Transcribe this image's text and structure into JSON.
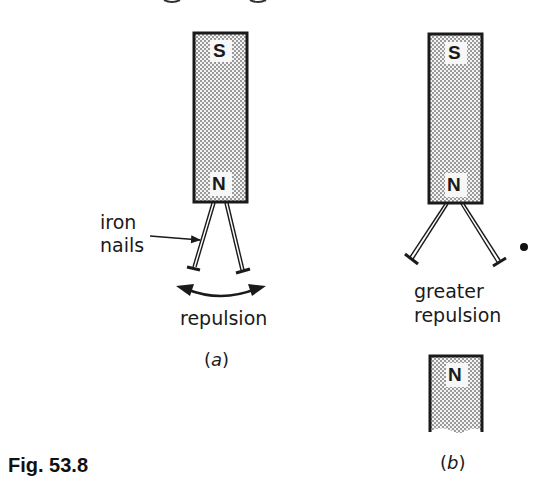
{
  "figure": {
    "label": "Fig. 53.8",
    "heading_fragment": "clipped heading text at top edge (not legible)"
  },
  "panel_a": {
    "caption_open": "(",
    "caption_letter": "a",
    "caption_close": ")",
    "magnet": {
      "top_pole": "S",
      "bottom_pole": "N"
    },
    "annotation_line1": "iron",
    "annotation_line2": "nails",
    "effect_label": "repulsion",
    "icons": [
      "arrow-pointer-icon",
      "double-headed-curved-arrow-icon"
    ]
  },
  "panel_b": {
    "caption_open": "(",
    "caption_letter": "b",
    "caption_close": ")",
    "magnet_upper": {
      "top_pole": "S",
      "bottom_pole": "N"
    },
    "magnet_lower": {
      "top_pole": "N"
    },
    "effect_label_line1": "greater",
    "effect_label_line2": "repulsion",
    "icons": [
      "dot-marker-icon"
    ]
  },
  "colors": {
    "ink": "#1a1a1a",
    "magnet_fill_dots": "#7a7a7a",
    "background": "#ffffff"
  }
}
